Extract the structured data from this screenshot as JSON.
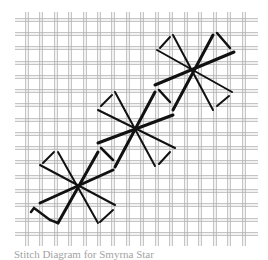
{
  "diagram": {
    "caption": "Stitch Diagram for Smyrna Star",
    "colors": {
      "background": "#ffffff",
      "grid_thread": "#b0b0b0",
      "stitch": "#111111"
    },
    "grid": {
      "vertical_x": [
        27,
        41,
        56,
        70,
        85,
        99,
        113,
        128,
        142,
        157,
        171,
        186,
        200,
        215,
        229,
        244
      ],
      "horizontal_y": [
        20,
        34,
        48,
        63,
        77,
        91,
        105,
        120,
        134,
        148,
        162,
        177,
        191,
        205,
        220,
        234
      ],
      "x_range": [
        15,
        258
      ],
      "y_range": [
        12,
        246
      ]
    },
    "stars": [
      {
        "name": "star-1",
        "center": [
          78,
          187
        ]
      },
      {
        "name": "star-2",
        "center": [
          135,
          127
        ]
      },
      {
        "name": "star-3",
        "center": [
          193,
          70
        ]
      }
    ]
  }
}
